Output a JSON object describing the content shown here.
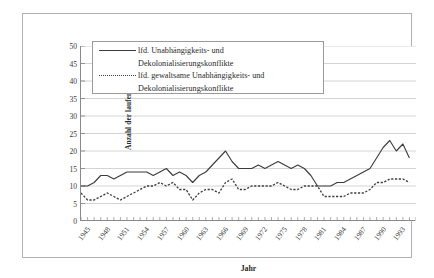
{
  "chart_data": {
    "type": "line",
    "title": "",
    "xlabel": "Jahr",
    "ylabel": "Anzahl der laufenden Konflikte",
    "ylim": [
      0,
      50
    ],
    "ytick_step": 5,
    "yticks": [
      0,
      5,
      10,
      15,
      20,
      25,
      30,
      35,
      40,
      45,
      50
    ],
    "xlim": [
      1945,
      1996
    ],
    "xticks": [
      1945,
      1948,
      1951,
      1954,
      1957,
      1960,
      1963,
      1966,
      1969,
      1972,
      1975,
      1978,
      1981,
      1984,
      1987,
      1990,
      1993
    ],
    "xtick_labels": [
      "1945",
      "1948",
      "1951",
      "1954",
      "1957",
      "1960",
      "1963",
      "1966",
      "1969",
      "1972",
      "1975",
      "1978",
      "1981",
      "1984",
      "1987",
      "1990",
      "1993"
    ],
    "grid": "horizontal",
    "legend_position": "upper-left-inside",
    "x": [
      1945,
      1946,
      1947,
      1948,
      1949,
      1950,
      1951,
      1952,
      1953,
      1954,
      1955,
      1956,
      1957,
      1958,
      1959,
      1960,
      1961,
      1962,
      1963,
      1964,
      1965,
      1966,
      1967,
      1968,
      1969,
      1970,
      1971,
      1972,
      1973,
      1974,
      1975,
      1976,
      1977,
      1978,
      1979,
      1980,
      1981,
      1982,
      1983,
      1984,
      1985,
      1986,
      1987,
      1988,
      1989,
      1990,
      1991,
      1992,
      1993,
      1994,
      1995
    ],
    "series": [
      {
        "name": "lfd. Unabhängigkeits- und Dekolonialisierungskonflikte",
        "style": "solid",
        "color": "#3c3c3c",
        "values": [
          10,
          10,
          11,
          13,
          13,
          12,
          13,
          14,
          14,
          14,
          14,
          13,
          14,
          15,
          13,
          14,
          13,
          11,
          13,
          14,
          16,
          18,
          20,
          17,
          15,
          15,
          15,
          16,
          15,
          16,
          17,
          16,
          15,
          16,
          15,
          13,
          10,
          10,
          10,
          11,
          11,
          12,
          13,
          14,
          15,
          18,
          21,
          23,
          20,
          22,
          18
        ]
      },
      {
        "name": "lfd. gewaltsame Unabhängigkeits- und Dekolonialisierungskonflikte",
        "style": "dotted",
        "color": "#3c3c3c",
        "values": [
          8,
          6,
          6,
          7,
          8,
          7,
          6,
          7,
          8,
          9,
          10,
          10,
          11,
          10,
          11,
          9,
          9,
          6,
          8,
          9,
          9,
          8,
          11,
          12,
          9,
          9,
          10,
          10,
          10,
          10,
          11,
          10,
          9,
          9,
          10,
          10,
          10,
          7,
          7,
          7,
          7,
          8,
          8,
          8,
          9,
          11,
          11,
          12,
          12,
          12,
          11
        ]
      }
    ]
  },
  "legend": {
    "entries": [
      {
        "line1": "lfd. Unabhängigkeits- und",
        "line2": "Dekolonialisierungskonflikte",
        "style": "solid"
      },
      {
        "line1": "lfd. gewaltsame Unabhängigkeits- und",
        "line2": "Dekolonialisierungskonflikte",
        "style": "dotted"
      }
    ]
  },
  "axes": {
    "y_title": "Anzahl der laufenden Konflikte",
    "x_title": "Jahr"
  }
}
